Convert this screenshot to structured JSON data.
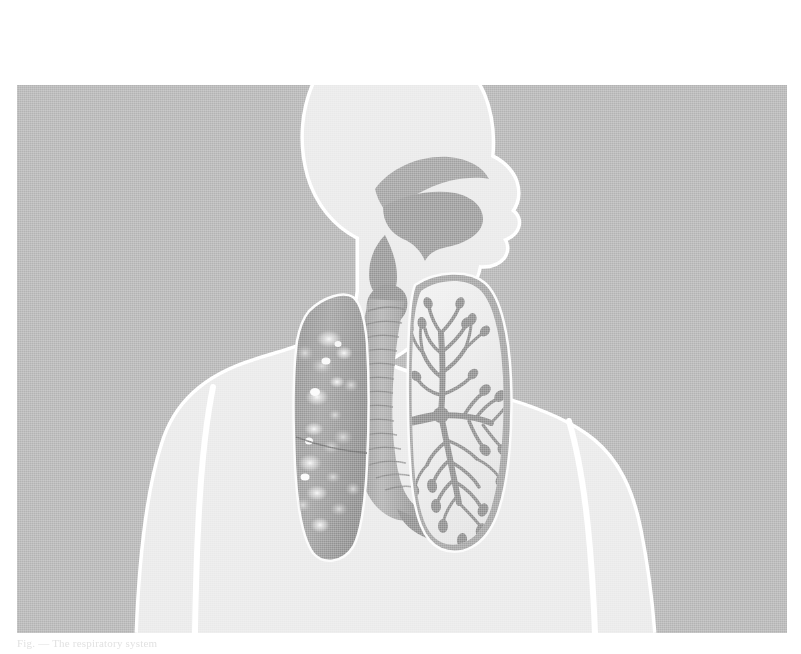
{
  "figure": {
    "caption": "Fig. — The respiratory system",
    "plate": {
      "x": 17,
      "y": 85,
      "width": 770,
      "height": 548
    },
    "colors": {
      "page_background": "#ffffff",
      "plate_background": "#b3b3b3",
      "body_fill": "#e8e8e8",
      "body_outline": "#ffffff",
      "airway_fill": "#9a9a9a",
      "airway_shade": "#8a8a8a",
      "diseased_lung": "#9b9b9b",
      "diseased_lung_spots": "#f2f2f2",
      "clear_lung_field": "#ededed",
      "bronchial_tree": "#8f8f8f"
    },
    "parts": [
      {
        "id": "head",
        "label": "Head (profile silhouette)"
      },
      {
        "id": "nasal-cavity",
        "label": "Nasal cavity"
      },
      {
        "id": "oral-cavity",
        "label": "Oral cavity / tongue"
      },
      {
        "id": "pharynx",
        "label": "Pharynx"
      },
      {
        "id": "larynx",
        "label": "Larynx"
      },
      {
        "id": "trachea",
        "label": "Trachea (ringed)"
      },
      {
        "id": "carina",
        "label": "Carina / bifurcation"
      },
      {
        "id": "left-lung",
        "label": "Diseased lung, whole (mottled with lesions)"
      },
      {
        "id": "lung-fissure",
        "label": "Oblique fissure"
      },
      {
        "id": "right-lung",
        "label": "Lung shown in section with bronchial tree"
      },
      {
        "id": "bronchial-tree",
        "label": "Bronchial tree"
      },
      {
        "id": "torso",
        "label": "Torso and shoulders"
      },
      {
        "id": "left-arm",
        "label": "Arm (viewer left)"
      },
      {
        "id": "right-arm",
        "label": "Arm (viewer right)"
      }
    ]
  }
}
